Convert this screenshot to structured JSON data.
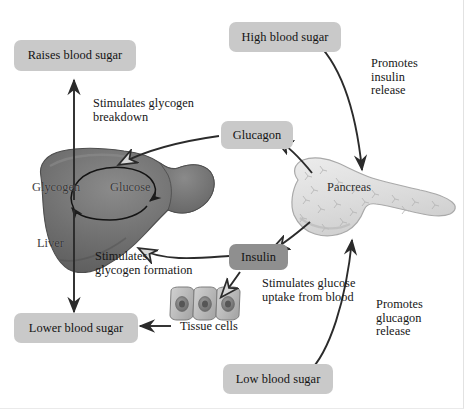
{
  "diagram": {
    "colors": {
      "box_light": "#c9c9c9",
      "box_dark": "#8f8f8f",
      "arrow": "#2b2b2b",
      "liver": "#6d6d6d",
      "pancreas": "#d8d8d8",
      "cell": "#bdbdbd",
      "background": "#ffffff"
    }
  },
  "boxes": {
    "raises_blood_sugar": "Raises blood sugar",
    "high_blood_sugar": "High blood sugar",
    "glucagon": "Glucagon",
    "insulin": "Insulin",
    "lower_blood_sugar": "Lower blood sugar",
    "low_blood_sugar": "Low blood sugar"
  },
  "annotations": {
    "stimulates_glycogen_breakdown": "Stimulates glycogen\nbreakdown",
    "stimulates_glycogen_formation": "Stimulates\nglycogen formation",
    "promotes_insulin_release": "Promotes\ninsulin\nrelease",
    "promotes_glucagon_release": "Promotes\nglucagon\nrelease",
    "stimulates_glucose_uptake": "Stimulates glucose\nuptake from blood"
  },
  "organs": {
    "liver": "Liver",
    "pancreas": "Pancreas",
    "tissue_cells": "Tissue cells",
    "glycogen": "Glycogen",
    "glucose": "Glucose"
  }
}
